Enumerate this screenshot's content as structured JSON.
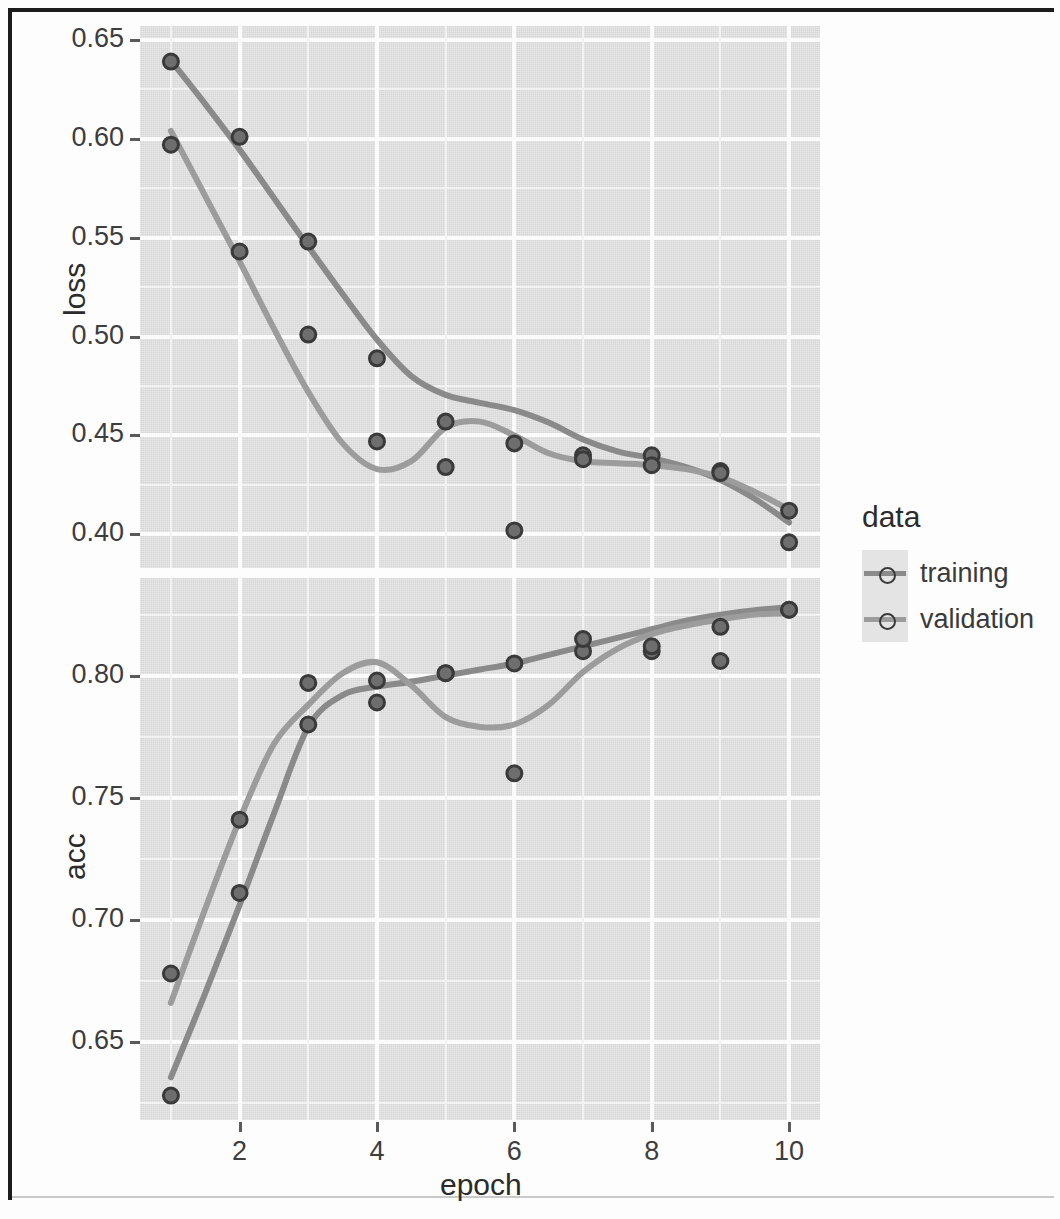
{
  "figure": {
    "x_axis_title": "epoch",
    "legend_title": "data",
    "series_names": [
      "training",
      "validation"
    ],
    "colors": {
      "training": "#8a8a8a",
      "validation": "#9c9c9c",
      "point_stroke": "#3a3a3a",
      "point_fill": "#6e6e6e",
      "panel_background": "#e4e4e4",
      "grid_major": "#fbfbfb",
      "grid_minor": "#f2f2f2",
      "axis_text": "#3d3d3d",
      "frame": "#1c1c1c"
    }
  },
  "panels": [
    {
      "id": "loss",
      "y_axis_title": "loss",
      "y_tick_labels": [
        "0.65",
        "0.60",
        "0.55",
        "0.50",
        "0.45",
        "0.40"
      ],
      "y_tick_values": [
        0.65,
        0.6,
        0.55,
        0.5,
        0.45,
        0.4
      ],
      "y_minor_values": [
        0.625,
        0.575,
        0.525,
        0.475,
        0.425
      ]
    },
    {
      "id": "acc",
      "y_axis_title": "acc",
      "y_tick_labels": [
        "0.80",
        "0.75",
        "0.70",
        "0.65"
      ],
      "y_tick_values": [
        0.8,
        0.75,
        0.7,
        0.65
      ],
      "y_minor_values": [
        0.825,
        0.775,
        0.725,
        0.675,
        0.625
      ]
    }
  ],
  "x_tick_labels": [
    "2",
    "4",
    "6",
    "8",
    "10"
  ],
  "x_tick_values": [
    2,
    4,
    6,
    8,
    10
  ],
  "x_minor_values": [
    1,
    3,
    5,
    7,
    9
  ],
  "chart_data": {
    "type": "scatter",
    "title": "",
    "subtitle": "",
    "xlabel": "epoch",
    "ylabel": "",
    "grid": true,
    "legend_position": "right",
    "legend_title": "data",
    "facets": [
      {
        "name": "loss",
        "ylabel": "loss",
        "ylim": [
          0.383,
          0.657
        ],
        "yticks": [
          0.4,
          0.45,
          0.5,
          0.55,
          0.6,
          0.65
        ],
        "series": [
          {
            "name": "training",
            "x": [
              1,
              2,
              3,
              4,
              5,
              6,
              7,
              8,
              9,
              10
            ],
            "values": [
              0.639,
              0.601,
              0.548,
              0.489,
              0.457,
              0.446,
              0.44,
              0.44,
              0.432,
              0.412
            ],
            "smooth": true
          },
          {
            "name": "validation",
            "x": [
              1,
              2,
              3,
              4,
              5,
              6,
              7,
              8,
              9,
              10
            ],
            "values": [
              0.597,
              0.543,
              0.501,
              0.447,
              0.434,
              0.402,
              0.438,
              0.435,
              0.431,
              0.396
            ],
            "smooth": true
          }
        ]
      },
      {
        "name": "acc",
        "ylabel": "acc",
        "ylim": [
          0.618,
          0.84
        ],
        "yticks": [
          0.65,
          0.7,
          0.75,
          0.8
        ],
        "series": [
          {
            "name": "training",
            "x": [
              1,
              2,
              3,
              4,
              5,
              6,
              7,
              8,
              9,
              10
            ],
            "values": [
              0.628,
              0.711,
              0.78,
              0.789,
              0.801,
              0.805,
              0.81,
              0.81,
              0.82,
              0.827
            ],
            "smooth": true
          },
          {
            "name": "validation",
            "x": [
              1,
              2,
              3,
              4,
              5,
              6,
              7,
              8,
              9,
              10
            ],
            "values": [
              0.678,
              0.741,
              0.797,
              0.798,
              0.801,
              0.76,
              0.815,
              0.812,
              0.806,
              0.827
            ],
            "smooth": true
          }
        ]
      }
    ],
    "x": [
      1,
      2,
      3,
      4,
      5,
      6,
      7,
      8,
      9,
      10
    ],
    "xticks": [
      2,
      4,
      6,
      8,
      10
    ],
    "xlim": [
      0.55,
      10.45
    ]
  },
  "fit_lines": {
    "loss": {
      "training": [
        [
          1,
          0.6395
        ],
        [
          1.5,
          0.6175
        ],
        [
          2,
          0.5945
        ],
        [
          2.5,
          0.57
        ],
        [
          3,
          0.5455
        ],
        [
          3.5,
          0.5215
        ],
        [
          4,
          0.4985
        ],
        [
          4.5,
          0.48
        ],
        [
          5,
          0.4705
        ],
        [
          5.5,
          0.4665
        ],
        [
          6,
          0.4628
        ],
        [
          6.5,
          0.4565
        ],
        [
          7,
          0.448
        ],
        [
          7.5,
          0.442
        ],
        [
          8,
          0.4385
        ],
        [
          8.5,
          0.434
        ],
        [
          9,
          0.4275
        ],
        [
          9.5,
          0.418
        ],
        [
          10,
          0.406
        ]
      ],
      "validation": [
        [
          1,
          0.604
        ],
        [
          1.5,
          0.571
        ],
        [
          2,
          0.538
        ],
        [
          2.5,
          0.504
        ],
        [
          3,
          0.472
        ],
        [
          3.5,
          0.446
        ],
        [
          4,
          0.433
        ],
        [
          4.5,
          0.437
        ],
        [
          5,
          0.454
        ],
        [
          5.5,
          0.457
        ],
        [
          6,
          0.45
        ],
        [
          6.5,
          0.441
        ],
        [
          7,
          0.437
        ],
        [
          7.5,
          0.436
        ],
        [
          8,
          0.435
        ],
        [
          8.5,
          0.433
        ],
        [
          9,
          0.429
        ],
        [
          9.5,
          0.4215
        ],
        [
          10,
          0.4125
        ]
      ]
    },
    "acc": {
      "training": [
        [
          1,
          0.6355
        ],
        [
          1.5,
          0.67
        ],
        [
          2,
          0.706
        ],
        [
          2.5,
          0.7435
        ],
        [
          3,
          0.779
        ],
        [
          3.5,
          0.792
        ],
        [
          4,
          0.7955
        ],
        [
          4.5,
          0.7975
        ],
        [
          5,
          0.8
        ],
        [
          5.5,
          0.8025
        ],
        [
          6,
          0.805
        ],
        [
          6.5,
          0.8085
        ],
        [
          7,
          0.812
        ],
        [
          7.5,
          0.8155
        ],
        [
          8,
          0.819
        ],
        [
          8.5,
          0.8225
        ],
        [
          9,
          0.825
        ],
        [
          9.5,
          0.8268
        ],
        [
          10,
          0.828
        ]
      ],
      "validation": [
        [
          1,
          0.666
        ],
        [
          1.5,
          0.7045
        ],
        [
          2,
          0.741
        ],
        [
          2.5,
          0.772
        ],
        [
          3,
          0.788
        ],
        [
          3.5,
          0.801
        ],
        [
          4,
          0.8055
        ],
        [
          4.5,
          0.796
        ],
        [
          5,
          0.783
        ],
        [
          5.5,
          0.779
        ],
        [
          6,
          0.78
        ],
        [
          6.5,
          0.788
        ],
        [
          7,
          0.8015
        ],
        [
          7.5,
          0.811
        ],
        [
          8,
          0.817
        ],
        [
          8.5,
          0.8205
        ],
        [
          9,
          0.823
        ],
        [
          9.5,
          0.825
        ],
        [
          10,
          0.8255
        ]
      ]
    }
  }
}
